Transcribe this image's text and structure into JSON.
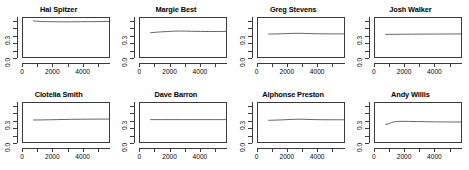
{
  "figure": {
    "layout": "2 rows x 4 columns of small-multiple line panels",
    "background_color": "#ffffff",
    "line_color": "#555555",
    "axis_color": "#3a3a3a"
  },
  "chart_data": [
    {
      "type": "line",
      "title": "Hal Spitzer",
      "xlabel": "",
      "ylabel": "",
      "xlim": [
        0,
        5800
      ],
      "ylim": [
        0.0,
        0.55
      ],
      "xticks": [
        0,
        1000,
        2000,
        3000,
        4000,
        5000
      ],
      "xtick_labels": [
        "0",
        "",
        "2000",
        "",
        "4000",
        ""
      ],
      "yticks": [
        0.0,
        0.1,
        0.2,
        0.3,
        0.4,
        0.5
      ],
      "ytick_labels": [
        "0.0",
        "",
        "",
        "0.3",
        "",
        ""
      ],
      "grid": false,
      "legend": "none",
      "x": [
        700,
        900,
        1200,
        1600,
        2000,
        2600,
        3200,
        3800,
        4400,
        5000,
        5500,
        5650
      ],
      "y": [
        0.512,
        0.507,
        0.503,
        0.501,
        0.5,
        0.499,
        0.499,
        0.5,
        0.501,
        0.502,
        0.503,
        0.503
      ]
    },
    {
      "type": "line",
      "title": "Margie Best",
      "xlabel": "",
      "ylabel": "",
      "xlim": [
        0,
        5800
      ],
      "ylim": [
        0.0,
        0.55
      ],
      "xticks": [
        0,
        1000,
        2000,
        3000,
        4000,
        5000
      ],
      "xtick_labels": [
        "0",
        "",
        "2000",
        "",
        "4000",
        ""
      ],
      "yticks": [
        0.0,
        0.1,
        0.2,
        0.3,
        0.4,
        0.5
      ],
      "ytick_labels": [
        "0.0",
        "",
        "",
        "0.3",
        "",
        ""
      ],
      "grid": false,
      "legend": "none",
      "x": [
        700,
        1000,
        1400,
        1800,
        2200,
        2600,
        3000,
        3400,
        4000,
        4600,
        5200,
        5650
      ],
      "y": [
        0.352,
        0.358,
        0.364,
        0.369,
        0.373,
        0.375,
        0.374,
        0.372,
        0.37,
        0.369,
        0.369,
        0.37
      ]
    },
    {
      "type": "line",
      "title": "Greg Stevens",
      "xlabel": "",
      "ylabel": "",
      "xlim": [
        0,
        5800
      ],
      "ylim": [
        0.0,
        0.55
      ],
      "xticks": [
        0,
        1000,
        2000,
        3000,
        4000,
        5000
      ],
      "xtick_labels": [
        "0",
        "",
        "2000",
        "",
        "4000",
        ""
      ],
      "yticks": [
        0.0,
        0.1,
        0.2,
        0.3,
        0.4,
        0.5
      ],
      "ytick_labels": [
        "0.0",
        "",
        "",
        "0.3",
        "",
        ""
      ],
      "grid": false,
      "legend": "none",
      "x": [
        700,
        1100,
        1500,
        1900,
        2300,
        2700,
        3100,
        3500,
        4100,
        4700,
        5300,
        5650
      ],
      "y": [
        0.335,
        0.336,
        0.338,
        0.341,
        0.344,
        0.345,
        0.343,
        0.34,
        0.338,
        0.337,
        0.337,
        0.337
      ]
    },
    {
      "type": "line",
      "title": "Josh Walker",
      "xlabel": "",
      "ylabel": "",
      "xlim": [
        0,
        5800
      ],
      "ylim": [
        0.0,
        0.55
      ],
      "xticks": [
        0,
        1000,
        2000,
        3000,
        4000,
        5000
      ],
      "xtick_labels": [
        "0",
        "",
        "2000",
        "",
        "4000",
        ""
      ],
      "yticks": [
        0.0,
        0.1,
        0.2,
        0.3,
        0.4,
        0.5
      ],
      "ytick_labels": [
        "0.0",
        "",
        "",
        "0.3",
        "",
        ""
      ],
      "grid": false,
      "legend": "none",
      "x": [
        700,
        1200,
        1800,
        2400,
        3000,
        3600,
        4200,
        4800,
        5300,
        5650
      ],
      "y": [
        0.33,
        0.331,
        0.332,
        0.333,
        0.334,
        0.334,
        0.335,
        0.335,
        0.336,
        0.336
      ]
    },
    {
      "type": "line",
      "title": "Clotelia Smith",
      "xlabel": "",
      "ylabel": "",
      "xlim": [
        0,
        5800
      ],
      "ylim": [
        0.0,
        0.55
      ],
      "xticks": [
        0,
        1000,
        2000,
        3000,
        4000,
        5000
      ],
      "xtick_labels": [
        "0",
        "",
        "2000",
        "",
        "4000",
        ""
      ],
      "yticks": [
        0.0,
        0.1,
        0.2,
        0.3,
        0.4,
        0.5
      ],
      "ytick_labels": [
        "0.0",
        "",
        "",
        "0.3",
        "",
        ""
      ],
      "grid": false,
      "legend": "none",
      "x": [
        700,
        1200,
        1700,
        2200,
        2700,
        3200,
        3800,
        4400,
        5000,
        5650
      ],
      "y": [
        0.322,
        0.323,
        0.325,
        0.327,
        0.329,
        0.331,
        0.332,
        0.333,
        0.334,
        0.334
      ]
    },
    {
      "type": "line",
      "title": "Dave Barron",
      "xlabel": "",
      "ylabel": "",
      "xlim": [
        0,
        5800
      ],
      "ylim": [
        0.0,
        0.55
      ],
      "xticks": [
        0,
        1000,
        2000,
        3000,
        4000,
        5000
      ],
      "xtick_labels": [
        "0",
        "",
        "2000",
        "",
        "4000",
        ""
      ],
      "yticks": [
        0.0,
        0.1,
        0.2,
        0.3,
        0.4,
        0.5
      ],
      "ytick_labels": [
        "0.0",
        "",
        "",
        "0.3",
        "",
        ""
      ],
      "grid": false,
      "legend": "none",
      "x": [
        700,
        1400,
        2100,
        2800,
        3500,
        4200,
        4900,
        5650
      ],
      "y": [
        0.327,
        0.327,
        0.327,
        0.327,
        0.327,
        0.327,
        0.327,
        0.327
      ]
    },
    {
      "type": "line",
      "title": "Alphonse Preston",
      "xlabel": "",
      "ylabel": "",
      "xlim": [
        0,
        5800
      ],
      "ylim": [
        0.0,
        0.55
      ],
      "xticks": [
        0,
        1000,
        2000,
        3000,
        4000,
        5000
      ],
      "xtick_labels": [
        "0",
        "",
        "2000",
        "",
        "4000",
        ""
      ],
      "yticks": [
        0.0,
        0.1,
        0.2,
        0.3,
        0.4,
        0.5
      ],
      "ytick_labels": [
        "0.0",
        "",
        "",
        "0.3",
        "",
        ""
      ],
      "grid": false,
      "legend": "none",
      "x": [
        700,
        1100,
        1500,
        1900,
        2300,
        2700,
        3100,
        3500,
        4100,
        4700,
        5300,
        5650
      ],
      "y": [
        0.318,
        0.32,
        0.323,
        0.327,
        0.331,
        0.333,
        0.331,
        0.328,
        0.326,
        0.325,
        0.325,
        0.325
      ]
    },
    {
      "type": "line",
      "title": "Andy Willis",
      "xlabel": "",
      "ylabel": "",
      "xlim": [
        0,
        5800
      ],
      "ylim": [
        0.0,
        0.55
      ],
      "xticks": [
        0,
        1000,
        2000,
        3000,
        4000,
        5000
      ],
      "xtick_labels": [
        "0",
        "",
        "2000",
        "",
        "4000",
        ""
      ],
      "yticks": [
        0.0,
        0.1,
        0.2,
        0.3,
        0.4,
        0.5
      ],
      "ytick_labels": [
        "0.0",
        "",
        "",
        "0.3",
        "",
        ""
      ],
      "grid": false,
      "legend": "none",
      "x": [
        700,
        900,
        1100,
        1300,
        1500,
        1800,
        2200,
        2800,
        3400,
        4000,
        4600,
        5200,
        5650
      ],
      "y": [
        0.262,
        0.272,
        0.288,
        0.298,
        0.303,
        0.304,
        0.303,
        0.301,
        0.299,
        0.297,
        0.296,
        0.295,
        0.295
      ]
    }
  ]
}
